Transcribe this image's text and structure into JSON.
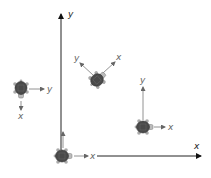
{
  "diagram": {
    "world_frame": {
      "x_label": "x",
      "y_label": "y",
      "axis_color": "#222222"
    },
    "turtle_color": "#555555",
    "frame_color": "#777777",
    "turtles": [
      {
        "id": "origin",
        "x_label": "x",
        "y_label": "y",
        "heading": "right"
      },
      {
        "id": "left",
        "x_label": "x",
        "y_label": "y",
        "heading": "down"
      },
      {
        "id": "rotated",
        "x_label": "x",
        "y_label": "y",
        "heading": "up-right-45"
      },
      {
        "id": "right",
        "x_label": "x",
        "y_label": "y",
        "heading": "right"
      }
    ]
  }
}
